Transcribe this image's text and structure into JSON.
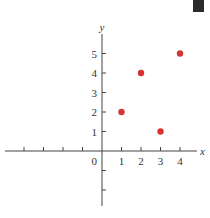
{
  "chart_data": {
    "type": "scatter",
    "title": "",
    "xlabel": "x",
    "ylabel": "y",
    "origin_label": "0",
    "x_ticks": [
      1,
      2,
      3,
      4
    ],
    "y_ticks": [
      1,
      2,
      3,
      4,
      5
    ],
    "xlim": [
      -5,
      5
    ],
    "ylim": [
      -3,
      6
    ],
    "grid": false,
    "points": [
      {
        "x": 1,
        "y": 2
      },
      {
        "x": 2,
        "y": 4
      },
      {
        "x": 3,
        "y": 1
      },
      {
        "x": 4,
        "y": 5
      }
    ],
    "marker_color": "#d63333"
  },
  "decor": {
    "corner_box_color": "#2b2b2b"
  }
}
